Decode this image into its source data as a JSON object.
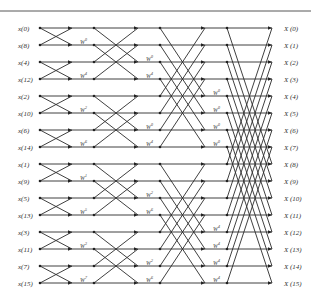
{
  "diagram": {
    "inputs": [
      "x(0)",
      "x(8)",
      "x(4)",
      "x(12)",
      "x(2)",
      "x(10)",
      "x(6)",
      "x(14)",
      "x(1)",
      "x(9)",
      "x(5)",
      "x(13)",
      "x(3)",
      "x(11)",
      "x(7)",
      "x(15)"
    ],
    "outputs": [
      "X (0)",
      "X (1)",
      "X (2)",
      "X (3)",
      "X (4)",
      "X (5)",
      "X (6)",
      "X (7)",
      "X (8)",
      "X (9)",
      "X (10)",
      "X (11)",
      "X (12)",
      "X (13)",
      "X (14)",
      "X (15)"
    ],
    "twiddle_base": "W",
    "stages": [
      {
        "span": 1,
        "twiddles": [
          {
            "row": 1,
            "exp": "0"
          },
          {
            "row": 3,
            "exp": "4"
          },
          {
            "row": 5,
            "exp": "2"
          },
          {
            "row": 7,
            "exp": "6"
          },
          {
            "row": 9,
            "exp": "1"
          },
          {
            "row": 11,
            "exp": "5"
          },
          {
            "row": 13,
            "exp": "3"
          },
          {
            "row": 15,
            "exp": "7"
          }
        ]
      },
      {
        "span": 2,
        "twiddles": [
          {
            "row": 2,
            "exp": "0"
          },
          {
            "row": 3,
            "exp": "4"
          },
          {
            "row": 6,
            "exp": "0"
          },
          {
            "row": 7,
            "exp": "4"
          },
          {
            "row": 10,
            "exp": "2"
          },
          {
            "row": 11,
            "exp": "6"
          },
          {
            "row": 14,
            "exp": "2"
          },
          {
            "row": 15,
            "exp": "6"
          }
        ]
      },
      {
        "span": 4,
        "twiddles": [
          {
            "row": 4,
            "exp": "0"
          },
          {
            "row": 5,
            "exp": "0"
          },
          {
            "row": 6,
            "exp": "0"
          },
          {
            "row": 7,
            "exp": "0"
          },
          {
            "row": 12,
            "exp": "4"
          },
          {
            "row": 13,
            "exp": "4"
          },
          {
            "row": 14,
            "exp": "4"
          },
          {
            "row": 15,
            "exp": "4"
          }
        ]
      },
      {
        "span": 8,
        "twiddles": []
      }
    ],
    "colors": {
      "line": "#2a2a2a",
      "text": "#333333",
      "background": "#ffffff"
    }
  }
}
